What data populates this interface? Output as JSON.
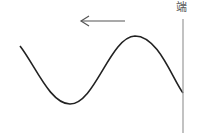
{
  "diagram": {
    "wall_label": "端",
    "arrow_direction": "left",
    "colors": {
      "wave": "#222222",
      "arrow": "#555555",
      "wall": "#999999",
      "label": "#555555"
    }
  }
}
